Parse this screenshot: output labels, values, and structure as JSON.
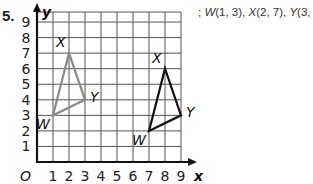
{
  "problem": {
    "number": "5.",
    "caption_prefix": "; ",
    "caption_parts": [
      {
        "name": "W",
        "coords": "(1, 3)"
      },
      {
        "name": "X",
        "coords": "(2, 7)"
      },
      {
        "name": "Y",
        "coords": "(3, 4)"
      }
    ]
  },
  "graph": {
    "origin_label": "O",
    "x_axis_label": "x",
    "y_axis_label": "y",
    "x_ticks": [
      "1",
      "2",
      "3",
      "4",
      "5",
      "6",
      "7",
      "8",
      "9"
    ],
    "y_ticks": [
      "1",
      "2",
      "3",
      "4",
      "5",
      "6",
      "7",
      "8",
      "9"
    ],
    "colors": {
      "grid": "#555555",
      "axes": "#111111",
      "preimage": "#8a8a8a",
      "image": "#111111"
    },
    "preimage": {
      "vertices": [
        {
          "label": "W",
          "x": 1,
          "y": 3
        },
        {
          "label": "X",
          "x": 2,
          "y": 7
        },
        {
          "label": "Y",
          "x": 3,
          "y": 4
        }
      ]
    },
    "image": {
      "vertices": [
        {
          "label": "W",
          "x": 7,
          "y": 2
        },
        {
          "label": "X",
          "x": 8,
          "y": 6
        },
        {
          "label": "Y",
          "x": 9,
          "y": 3
        }
      ]
    }
  }
}
